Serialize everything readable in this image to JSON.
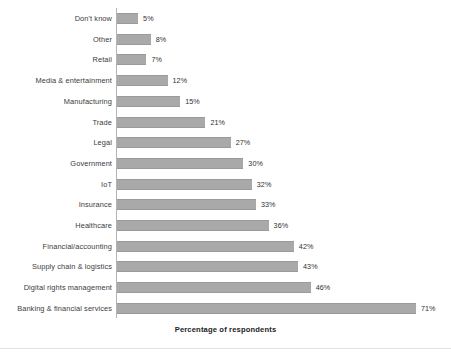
{
  "chart_data": {
    "type": "bar",
    "orientation": "horizontal",
    "title": "",
    "xlabel": "Percentage of respondents",
    "ylabel": "",
    "xlim": [
      0,
      71
    ],
    "grid": false,
    "legend": null,
    "value_suffix": "%",
    "bar_color": "#a9a9a9",
    "categories": [
      "Don't know",
      "Other",
      "Retail",
      "Media & entertainment",
      "Manufacturing",
      "Trade",
      "Legal",
      "Government",
      "IoT",
      "Insurance",
      "Healthcare",
      "Financial/accounting",
      "Supply chain & logistics",
      "Digital rights management",
      "Banking & financial services"
    ],
    "values": [
      5,
      8,
      7,
      12,
      15,
      21,
      27,
      30,
      32,
      33,
      36,
      42,
      43,
      46,
      71
    ],
    "value_labels": [
      "5%",
      "8%",
      "7%",
      "12%",
      "15%",
      "21%",
      "27%",
      "30%",
      "32%",
      "33%",
      "36%",
      "42%",
      "43%",
      "46%",
      "71%"
    ]
  }
}
